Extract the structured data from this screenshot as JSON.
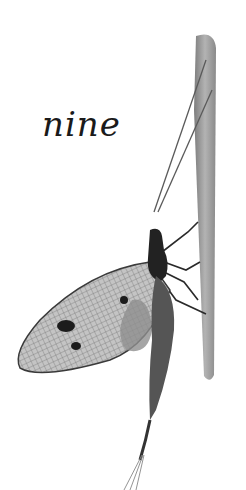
{
  "caption": {
    "word": "nine"
  },
  "illustration": {
    "subject": "mayfly on a plant stem",
    "colors": {
      "ink": "#1f1f1f",
      "stem": "#9a9a9a",
      "wing": "#bdbdbd",
      "background": "#ffffff"
    }
  }
}
